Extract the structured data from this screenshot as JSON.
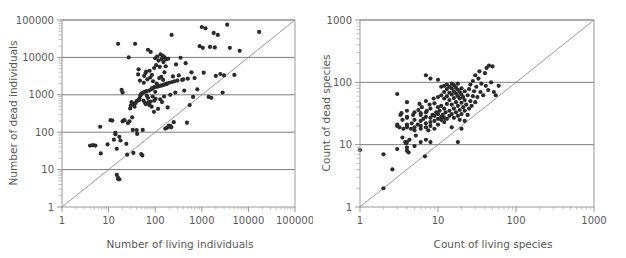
{
  "figure": {
    "name": "two-panel-log-log-scatter",
    "background": "#ffffff",
    "point_color": "#2b2b2b",
    "gridline_color": "#7d7d7d",
    "frame_color": "#9a9a9a",
    "reference_line_color": "#8d8d8d"
  },
  "chart_data": [
    {
      "type": "scatter",
      "panel": "left",
      "title": "",
      "xlabel": "Number of living individuals",
      "ylabel": "Number of dead individuals",
      "xscale": "log",
      "yscale": "log",
      "xlim": [
        1,
        100000
      ],
      "ylim": [
        1,
        100000
      ],
      "xticks": [
        1,
        10,
        100,
        1000,
        10000,
        100000
      ],
      "yticks": [
        1,
        10,
        100,
        1000,
        10000,
        100000
      ],
      "xticklabels": [
        "1",
        "10",
        "100",
        "1000",
        "10000",
        "100000"
      ],
      "yticklabels": [
        "1",
        "10",
        "100",
        "1000",
        "10000",
        "100000"
      ],
      "grid": "horizontal-major",
      "legend": "none",
      "annotations": [
        "1:1 reference line from (1,1) to (100000,100000)"
      ],
      "reference_line": {
        "slope": 1,
        "intercept": 0,
        "from": [
          1,
          1
        ],
        "to": [
          100000,
          100000
        ]
      },
      "n_points": 162,
      "points": [
        [
          4.0,
          44
        ],
        [
          4.6,
          45
        ],
        [
          5.2,
          44
        ],
        [
          6.6,
          140
        ],
        [
          6.8,
          27
        ],
        [
          9.5,
          47
        ],
        [
          11,
          210
        ],
        [
          12,
          205
        ],
        [
          13,
          63
        ],
        [
          14,
          88
        ],
        [
          14,
          96
        ],
        [
          15,
          36
        ],
        [
          15,
          7.2
        ],
        [
          16,
          23000
        ],
        [
          16,
          5.6
        ],
        [
          16,
          6.0
        ],
        [
          17,
          5.5
        ],
        [
          17,
          75
        ],
        [
          18,
          60
        ],
        [
          19,
          1350
        ],
        [
          20,
          1150
        ],
        [
          20,
          195
        ],
        [
          21,
          205
        ],
        [
          22,
          210
        ],
        [
          24,
          49
        ],
        [
          25,
          25
        ],
        [
          26,
          175
        ],
        [
          27,
          10000
        ],
        [
          28,
          195
        ],
        [
          29,
          430
        ],
        [
          30,
          520
        ],
        [
          31,
          640
        ],
        [
          32,
          250
        ],
        [
          33,
          115
        ],
        [
          34,
          28
        ],
        [
          35,
          580
        ],
        [
          36,
          480
        ],
        [
          37,
          23000
        ],
        [
          38,
          600
        ],
        [
          40,
          680
        ],
        [
          40,
          114
        ],
        [
          41,
          90
        ],
        [
          42,
          700
        ],
        [
          43,
          3500
        ],
        [
          44,
          4800
        ],
        [
          45,
          730
        ],
        [
          46,
          800
        ],
        [
          47,
          2400
        ],
        [
          48,
          950
        ],
        [
          49,
          1000
        ],
        [
          50,
          26
        ],
        [
          50,
          1050
        ],
        [
          52,
          1100
        ],
        [
          53,
          24
        ],
        [
          54,
          115
        ],
        [
          55,
          1150
        ],
        [
          56,
          700
        ],
        [
          57,
          2100
        ],
        [
          58,
          3200
        ],
        [
          60,
          620
        ],
        [
          60,
          1200
        ],
        [
          62,
          3800
        ],
        [
          63,
          560
        ],
        [
          64,
          4200
        ],
        [
          65,
          1250
        ],
        [
          66,
          950
        ],
        [
          68,
          2600
        ],
        [
          70,
          16000
        ],
        [
          70,
          820
        ],
        [
          72,
          640
        ],
        [
          74,
          1300
        ],
        [
          75,
          530
        ],
        [
          76,
          4400
        ],
        [
          78,
          2900
        ],
        [
          80,
          660
        ],
        [
          80,
          14000
        ],
        [
          82,
          1400
        ],
        [
          84,
          480
        ],
        [
          85,
          3400
        ],
        [
          86,
          1500
        ],
        [
          88,
          900
        ],
        [
          90,
          2300
        ],
        [
          92,
          1550
        ],
        [
          94,
          350
        ],
        [
          95,
          5200
        ],
        [
          96,
          700
        ],
        [
          98,
          1600
        ],
        [
          100,
          9500
        ],
        [
          100,
          1200
        ],
        [
          102,
          780
        ],
        [
          105,
          6200
        ],
        [
          108,
          2000
        ],
        [
          110,
          10500
        ],
        [
          112,
          1650
        ],
        [
          115,
          420
        ],
        [
          118,
          8200
        ],
        [
          120,
          1700
        ],
        [
          122,
          2800
        ],
        [
          125,
          5600
        ],
        [
          128,
          760
        ],
        [
          130,
          12000
        ],
        [
          132,
          1750
        ],
        [
          135,
          3000
        ],
        [
          138,
          9000
        ],
        [
          140,
          640
        ],
        [
          142,
          1800
        ],
        [
          145,
          11000
        ],
        [
          148,
          2500
        ],
        [
          150,
          7500
        ],
        [
          152,
          1850
        ],
        [
          155,
          900
        ],
        [
          158,
          4000
        ],
        [
          160,
          10000
        ],
        [
          162,
          1900
        ],
        [
          165,
          125
        ],
        [
          168,
          5800
        ],
        [
          170,
          8800
        ],
        [
          175,
          1950
        ],
        [
          178,
          130
        ],
        [
          180,
          2000
        ],
        [
          185,
          460
        ],
        [
          190,
          9200
        ],
        [
          195,
          150
        ],
        [
          200,
          2100
        ],
        [
          205,
          140
        ],
        [
          210,
          1000
        ],
        [
          215,
          145
        ],
        [
          220,
          135
        ],
        [
          225,
          40000
        ],
        [
          230,
          2200
        ],
        [
          240,
          3100
        ],
        [
          250,
          185
        ],
        [
          260,
          2300
        ],
        [
          270,
          1150
        ],
        [
          280,
          6500
        ],
        [
          300,
          2400
        ],
        [
          320,
          3300
        ],
        [
          350,
          9800
        ],
        [
          380,
          2500
        ],
        [
          400,
          2600
        ],
        [
          420,
          1300
        ],
        [
          450,
          7000
        ],
        [
          480,
          180
        ],
        [
          500,
          2700
        ],
        [
          550,
          530
        ],
        [
          600,
          4000
        ],
        [
          650,
          880
        ],
        [
          700,
          2800
        ],
        [
          800,
          1400
        ],
        [
          900,
          20000
        ],
        [
          1000,
          65000
        ],
        [
          1050,
          18000
        ],
        [
          1100,
          3900
        ],
        [
          1200,
          60000
        ],
        [
          1400,
          880
        ],
        [
          1500,
          19000
        ],
        [
          1600,
          830
        ],
        [
          1800,
          45000
        ],
        [
          1900,
          18500
        ],
        [
          2000,
          3200
        ],
        [
          2200,
          40000
        ],
        [
          2500,
          3600
        ],
        [
          2800,
          1150
        ],
        [
          3000,
          3300
        ],
        [
          3500,
          75000
        ],
        [
          4000,
          18000
        ],
        [
          5000,
          3400
        ],
        [
          6500,
          15000
        ],
        [
          17000,
          48000
        ]
      ]
    },
    {
      "type": "scatter",
      "panel": "right",
      "title": "",
      "xlabel": "Count of living species",
      "ylabel": "Count of dead species",
      "xscale": "log",
      "yscale": "log",
      "xlim": [
        1,
        1000
      ],
      "ylim": [
        1,
        1000
      ],
      "xticks": [
        1,
        10,
        100,
        1000
      ],
      "yticks": [
        1,
        10,
        100,
        1000
      ],
      "xticklabels": [
        "1",
        "10",
        "100",
        "1000"
      ],
      "yticklabels": [
        "1",
        "10",
        "100",
        "1000"
      ],
      "grid": "horizontal-major",
      "legend": "none",
      "annotations": [
        "1:1 reference line from (1,1) to (1000,1000)"
      ],
      "reference_line": {
        "slope": 1,
        "intercept": 0,
        "from": [
          1,
          1
        ],
        "to": [
          1000,
          1000
        ]
      },
      "n_points": 165,
      "points": [
        [
          1.0,
          8.2
        ],
        [
          2.0,
          7.0
        ],
        [
          2.0,
          2.0
        ],
        [
          2.6,
          4.0
        ],
        [
          3.0,
          65
        ],
        [
          3.0,
          8.5
        ],
        [
          3.0,
          20
        ],
        [
          3.0,
          21
        ],
        [
          3.2,
          19
        ],
        [
          3.3,
          30
        ],
        [
          3.4,
          32
        ],
        [
          3.5,
          13
        ],
        [
          3.5,
          25
        ],
        [
          3.6,
          18
        ],
        [
          3.8,
          11
        ],
        [
          3.9,
          10.5
        ],
        [
          4.0,
          8.0
        ],
        [
          4.0,
          9.0
        ],
        [
          4.0,
          11
        ],
        [
          4.0,
          19
        ],
        [
          4.0,
          20
        ],
        [
          4.0,
          21
        ],
        [
          4.0,
          27
        ],
        [
          4.0,
          28
        ],
        [
          4.0,
          35
        ],
        [
          4.0,
          48
        ],
        [
          4.2,
          7.5
        ],
        [
          4.3,
          12
        ],
        [
          4.5,
          18
        ],
        [
          4.6,
          22
        ],
        [
          4.8,
          30
        ],
        [
          5.0,
          9.5
        ],
        [
          5.0,
          17
        ],
        [
          5.0,
          19
        ],
        [
          5.0,
          25
        ],
        [
          5.0,
          33
        ],
        [
          5.2,
          14
        ],
        [
          5.5,
          21
        ],
        [
          5.6,
          36
        ],
        [
          5.8,
          45
        ],
        [
          6.0,
          11
        ],
        [
          6.0,
          18
        ],
        [
          6.0,
          20
        ],
        [
          6.0,
          24
        ],
        [
          6.0,
          30
        ],
        [
          6.0,
          32
        ],
        [
          6.2,
          40
        ],
        [
          6.5,
          26
        ],
        [
          6.8,
          6.5
        ],
        [
          7.0,
          12
        ],
        [
          7.0,
          19
        ],
        [
          7.0,
          22
        ],
        [
          7.0,
          28
        ],
        [
          7.0,
          33
        ],
        [
          7.0,
          50
        ],
        [
          7.0,
          130
        ],
        [
          7.2,
          35
        ],
        [
          7.5,
          17
        ],
        [
          7.8,
          44
        ],
        [
          8.0,
          11
        ],
        [
          8.0,
          20
        ],
        [
          8.0,
          23
        ],
        [
          8.0,
          27
        ],
        [
          8.0,
          38
        ],
        [
          8.0,
          115
        ],
        [
          8.5,
          30
        ],
        [
          8.8,
          55
        ],
        [
          9.0,
          18
        ],
        [
          9.0,
          24
        ],
        [
          9.0,
          29
        ],
        [
          9.0,
          46
        ],
        [
          9.5,
          33
        ],
        [
          10,
          21
        ],
        [
          10,
          26
        ],
        [
          10,
          31
        ],
        [
          10,
          40
        ],
        [
          10,
          58
        ],
        [
          10,
          110
        ],
        [
          10.5,
          35
        ],
        [
          11,
          25
        ],
        [
          11,
          28
        ],
        [
          11,
          42
        ],
        [
          11,
          62
        ],
        [
          11,
          85
        ],
        [
          11.5,
          30
        ],
        [
          12,
          23
        ],
        [
          12,
          27
        ],
        [
          12,
          38
        ],
        [
          12,
          55
        ],
        [
          12,
          70
        ],
        [
          12,
          88
        ],
        [
          12.5,
          33
        ],
        [
          13,
          26
        ],
        [
          13,
          45
        ],
        [
          13,
          60
        ],
        [
          13,
          78
        ],
        [
          13,
          92
        ],
        [
          14,
          29
        ],
        [
          14,
          35
        ],
        [
          14,
          52
        ],
        [
          14,
          68
        ],
        [
          14,
          85
        ],
        [
          15,
          19
        ],
        [
          15,
          31
        ],
        [
          15,
          44
        ],
        [
          15,
          64
        ],
        [
          15,
          80
        ],
        [
          15,
          95
        ],
        [
          16,
          27
        ],
        [
          16,
          38
        ],
        [
          16,
          56
        ],
        [
          16,
          72
        ],
        [
          16,
          90
        ],
        [
          17,
          33
        ],
        [
          17,
          48
        ],
        [
          17,
          66
        ],
        [
          17,
          82
        ],
        [
          18,
          11
        ],
        [
          18,
          29
        ],
        [
          18,
          42
        ],
        [
          18,
          60
        ],
        [
          18,
          76
        ],
        [
          18,
          95
        ],
        [
          19,
          25
        ],
        [
          19,
          36
        ],
        [
          19,
          55
        ],
        [
          19,
          70
        ],
        [
          20,
          18
        ],
        [
          20,
          31
        ],
        [
          20,
          47
        ],
        [
          20,
          64
        ],
        [
          20,
          80
        ],
        [
          21,
          40
        ],
        [
          21,
          58
        ],
        [
          22,
          24
        ],
        [
          22,
          35
        ],
        [
          22,
          52
        ],
        [
          22,
          72
        ],
        [
          23,
          44
        ],
        [
          24,
          30
        ],
        [
          24,
          62
        ],
        [
          25,
          38
        ],
        [
          25,
          78
        ],
        [
          26,
          50
        ],
        [
          26,
          92
        ],
        [
          27,
          42
        ],
        [
          28,
          60
        ],
        [
          28,
          105
        ],
        [
          29,
          72
        ],
        [
          30,
          48
        ],
        [
          30,
          130
        ],
        [
          31,
          85
        ],
        [
          32,
          58
        ],
        [
          33,
          115
        ],
        [
          34,
          150
        ],
        [
          35,
          70
        ],
        [
          36,
          95
        ],
        [
          38,
          62
        ],
        [
          40,
          140
        ],
        [
          41,
          88
        ],
        [
          42,
          170
        ],
        [
          44,
          75
        ],
        [
          45,
          185
        ],
        [
          48,
          100
        ],
        [
          50,
          180
        ],
        [
          52,
          70
        ],
        [
          55,
          62
        ],
        [
          60,
          88
        ]
      ]
    }
  ],
  "panels": {
    "left": {
      "name": "number-of-dead-vs-living-individuals",
      "xlabel": "Number of living individuals",
      "ylabel": "Number of dead individuals",
      "xticklabels": [
        "1",
        "10",
        "100",
        "1000",
        "10000",
        "100000"
      ],
      "yticklabels": [
        "1",
        "10",
        "100",
        "1000",
        "10000",
        "100000"
      ]
    },
    "right": {
      "name": "count-of-dead-vs-living-species",
      "xlabel": "Count of living species",
      "ylabel": "Count of dead species",
      "xticklabels": [
        "1",
        "10",
        "100",
        "1000"
      ],
      "yticklabels": [
        "1",
        "10",
        "100",
        "1000"
      ]
    }
  }
}
